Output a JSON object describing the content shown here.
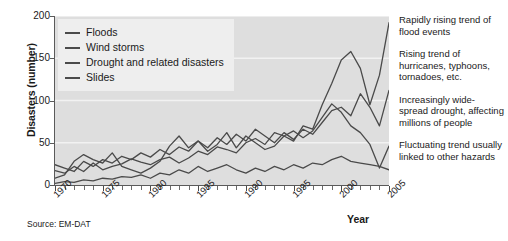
{
  "figure": {
    "source_note": "Source: EM-DAT"
  },
  "chart_data": {
    "type": "line",
    "title": "",
    "xlabel": "Year",
    "ylabel": "Disasters (number)",
    "xlim": [
      1970,
      2005
    ],
    "ylim": [
      0,
      200
    ],
    "grid": true,
    "grid_axis": "y",
    "legend_position": "top-left",
    "y_ticks": [
      0,
      50,
      100,
      150,
      200
    ],
    "y_tick_labels": [
      "0",
      "50",
      "100",
      "150",
      "200"
    ],
    "x_ticks": [
      1970,
      1975,
      1980,
      1985,
      1990,
      1995,
      2000,
      2005
    ],
    "x_tick_labels": [
      "1970",
      "1975",
      "1980",
      "1985",
      "1990",
      "1995",
      "2000",
      "2005"
    ],
    "x_minor_tick_interval": 1,
    "line_color": "#4a4a4a",
    "plot_background": "#dedede",
    "x": [
      1970,
      1971,
      1972,
      1973,
      1974,
      1975,
      1976,
      1977,
      1978,
      1979,
      1980,
      1981,
      1982,
      1983,
      1984,
      1985,
      1986,
      1987,
      1988,
      1989,
      1990,
      1991,
      1992,
      1993,
      1994,
      1995,
      1996,
      1997,
      1998,
      1999,
      2000,
      2001,
      2002,
      2003,
      2004,
      2005
    ],
    "series": [
      {
        "name": "Floods",
        "values": [
          17,
          14,
          22,
          16,
          26,
          18,
          22,
          25,
          31,
          27,
          24,
          30,
          33,
          26,
          32,
          40,
          36,
          45,
          42,
          38,
          50,
          55,
          48,
          62,
          58,
          52,
          70,
          66,
          95,
          120,
          148,
          158,
          138,
          95,
          130,
          192
        ]
      },
      {
        "name": "Wind storms",
        "values": [
          24,
          20,
          16,
          28,
          22,
          30,
          26,
          34,
          30,
          38,
          33,
          42,
          36,
          45,
          40,
          52,
          44,
          56,
          48,
          60,
          52,
          66,
          58,
          50,
          62,
          54,
          66,
          60,
          74,
          88,
          92,
          82,
          108,
          92,
          70,
          112
        ]
      },
      {
        "name": "Drought and related disasters",
        "values": [
          8,
          12,
          28,
          36,
          30,
          26,
          38,
          22,
          18,
          14,
          20,
          28,
          46,
          58,
          44,
          52,
          40,
          48,
          62,
          44,
          58,
          50,
          42,
          46,
          58,
          64,
          56,
          64,
          80,
          96,
          86,
          70,
          62,
          48,
          20,
          46
        ]
      },
      {
        "name": "Slides",
        "values": [
          2,
          4,
          3,
          6,
          5,
          8,
          7,
          10,
          9,
          12,
          8,
          14,
          12,
          18,
          14,
          22,
          16,
          20,
          24,
          18,
          14,
          20,
          16,
          22,
          18,
          24,
          20,
          26,
          24,
          30,
          34,
          28,
          26,
          24,
          22,
          18
        ]
      }
    ],
    "legend": [
      {
        "label": "Floods"
      },
      {
        "label": "Wind storms"
      },
      {
        "label": "Drought and related disasters"
      },
      {
        "label": "Slides"
      }
    ],
    "annotations": [
      {
        "text": "Rapidly rising trend of flood events"
      },
      {
        "text": "Rising trend of hurricanes, typhoons, tornadoes, etc."
      },
      {
        "text": "Increasingly wide-spread drought, affecting millions of people"
      },
      {
        "text": "Fluctuating trend usually linked to other hazards"
      }
    ]
  }
}
